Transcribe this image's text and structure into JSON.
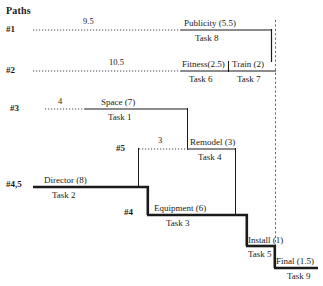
{
  "diagram": {
    "title": "Paths",
    "type": "project-network-path-chart",
    "time_axis_unit": "weeks"
  },
  "paths": [
    {
      "id": "path-1",
      "label": "#1",
      "lag": {
        "value": "9.5",
        "style": "dotted",
        "x_start": 33,
        "x_end": 182,
        "y": 30
      },
      "tasks": [
        {
          "name": "Publicity (5.5)",
          "task": "Task 8",
          "x_start": 182,
          "x_end": 272,
          "y": 30
        }
      ]
    },
    {
      "id": "path-2",
      "label": "#2",
      "lag": {
        "value": "10.5",
        "style": "dotted",
        "x_start": 33,
        "x_end": 182,
        "y": 71
      },
      "tasks": [
        {
          "name": "Fitness(2.5)",
          "task": "Task 6",
          "x_start": 182,
          "x_end": 229,
          "y": 71
        },
        {
          "name": "Train (2)",
          "task": "Task 7",
          "x_start": 229,
          "x_end": 275,
          "y": 71
        }
      ]
    },
    {
      "id": "path-3",
      "label": "#3",
      "lag": {
        "value": "4",
        "style": "dotted",
        "x_start": 45,
        "x_end": 85,
        "y": 109
      },
      "tasks": [
        {
          "name": "Space (7)",
          "task": "Task 1",
          "x_start": 85,
          "x_end": 188,
          "y": 109
        }
      ]
    },
    {
      "id": "path-5",
      "label": "#5",
      "lag": {
        "value": "3",
        "style": "dotted",
        "x_start": 138,
        "x_end": 188,
        "y": 149
      },
      "tasks": [
        {
          "name": "Remodel (3)",
          "task": "Task 4",
          "x_start": 188,
          "x_end": 235,
          "y": 149
        }
      ]
    },
    {
      "id": "path-4-5",
      "label": "#4,5",
      "tasks": [
        {
          "name": "Director (8)",
          "task": "Task 2",
          "x_start": 33,
          "x_end": 148,
          "y": 187
        }
      ]
    },
    {
      "id": "path-4",
      "label": "#4",
      "tasks": [
        {
          "name": "Equipment (6)",
          "task": "Task 3",
          "x_start": 148,
          "x_end": 247,
          "y": 215
        },
        {
          "name": "Install (1)",
          "task": "Task 5",
          "x_start": 247,
          "x_end": 275,
          "y": 246
        },
        {
          "name": "Final (1.5)",
          "task": "Task 9",
          "x_start": 275,
          "x_end": 318,
          "y": 268
        }
      ]
    }
  ],
  "labels": {
    "title": "Paths",
    "path1_id": "#1",
    "path1_lag": "9.5",
    "path1_task_a_name": "Publicity (5.5)",
    "path1_task_a_num": "Task 8",
    "path2_id": "#2",
    "path2_lag": "10.5",
    "path2_task_a_name": "Fitness(2.5)",
    "path2_task_a_num": "Task 6",
    "path2_task_b_name": "Train (2)",
    "path2_task_b_num": "Task 7",
    "path3_id": "#3",
    "path3_lag": "4",
    "path3_task_a_name": "Space (7)",
    "path3_task_a_num": "Task 1",
    "path5_id": "#5",
    "path5_lag": "3",
    "path5_task_a_name": "Remodel (3)",
    "path5_task_a_num": "Task 4",
    "path45_id": "#4,5",
    "path45_task_a_name": "Director (8)",
    "path45_task_a_num": "Task 2",
    "path4_id": "#4",
    "path4_task_a_name": "Equipment (6)",
    "path4_task_a_num": "Task 3",
    "path4_task_b_name": "Install (1)",
    "path4_task_b_num": "Task 5",
    "path4_task_c_name": "Final (1.5)",
    "path4_task_c_num": "Task 9"
  },
  "colors": {
    "ink": "#1a1a1a",
    "background": "#ffffff",
    "thin_rule": "#3a3a3a",
    "dotted": "#555555"
  }
}
